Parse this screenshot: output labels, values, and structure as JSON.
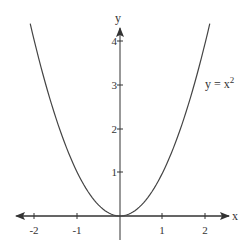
{
  "chart_data": {
    "type": "line",
    "title": "",
    "xlabel": "x",
    "ylabel": "y",
    "xlim": [
      -2.4,
      2.5
    ],
    "ylim": [
      -0.3,
      4.4
    ],
    "x_ticks": [
      "-2",
      "-1",
      "1",
      "2"
    ],
    "x_tick_values": [
      -2,
      -1,
      1,
      2
    ],
    "y_ticks": [
      "1",
      "2",
      "3",
      "4"
    ],
    "y_tick_values": [
      1,
      2,
      3,
      4
    ],
    "grid": false,
    "series": [
      {
        "name": "y = x²",
        "function": "x^2",
        "x": [
          -2.1,
          -2,
          -1.5,
          -1,
          -0.5,
          0,
          0.5,
          1,
          1.5,
          2,
          2.1
        ],
        "values": [
          4.41,
          4,
          2.25,
          1,
          0.25,
          0,
          0.25,
          1,
          2.25,
          4,
          4.41
        ]
      }
    ],
    "annotations": [
      {
        "text": "y = x",
        "superscript": "2",
        "x": 2.0,
        "y": 3.0
      }
    ]
  },
  "labels": {
    "x_axis": "x",
    "y_axis": "y",
    "curve_label_base": "y = x",
    "curve_label_exp": "2",
    "x_tick_labels": [
      "-2",
      "-1",
      "1",
      "2"
    ],
    "y_tick_labels": [
      "1",
      "2",
      "3",
      "4"
    ]
  },
  "colors": {
    "axis": "#333333",
    "curve": "#444444",
    "text": "#333333"
  }
}
